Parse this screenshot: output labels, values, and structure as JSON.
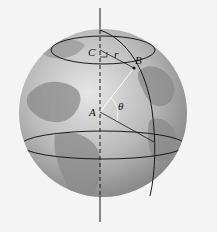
{
  "figure": {
    "labels": {
      "C": "C",
      "B": "B",
      "A": "A",
      "r": "r",
      "theta": "θ"
    },
    "colors": {
      "background": "#f4f4f4",
      "ocean_light": "#d9d9d9",
      "ocean_dark": "#8c8c8c",
      "land": "#7a7a7a",
      "lines": "#1a1a1a",
      "construction_lines": "#ffffff"
    }
  }
}
